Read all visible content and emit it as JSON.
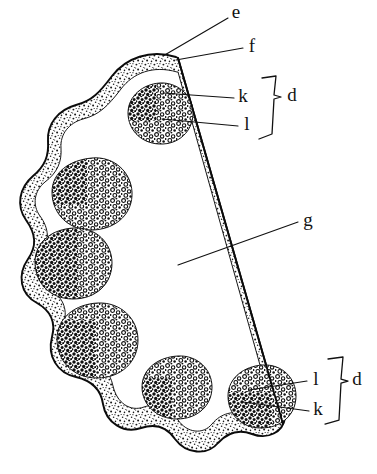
{
  "figure": {
    "background_color": "#ffffff",
    "ink_color": "#111111",
    "stipple_color": "#1b1b1b"
  },
  "labels": [
    {
      "id": "label-e",
      "text": "e",
      "x": 236,
      "y": 14
    },
    {
      "id": "label-f",
      "text": "f",
      "x": 252,
      "y": 48
    },
    {
      "id": "label-k-top",
      "text": "k",
      "x": 243,
      "y": 98
    },
    {
      "id": "label-l-top",
      "text": "l",
      "x": 247,
      "y": 126
    },
    {
      "id": "label-d-top",
      "text": "d",
      "x": 292,
      "y": 97
    },
    {
      "id": "label-g",
      "text": "g",
      "x": 308,
      "y": 222
    },
    {
      "id": "label-l-bottom",
      "text": "l",
      "x": 316,
      "y": 381
    },
    {
      "id": "label-k-bottom",
      "text": "k",
      "x": 318,
      "y": 411
    },
    {
      "id": "label-d-bottom",
      "text": "d",
      "x": 357,
      "y": 381
    }
  ],
  "leaders": [
    {
      "id": "leader-e",
      "from_label": "e",
      "points": "228,18 163,56"
    },
    {
      "id": "leader-f",
      "from_label": "f",
      "points": "243,48 176,60"
    },
    {
      "id": "leader-k-top",
      "from_label": "k",
      "points": "234,98 163,93"
    },
    {
      "id": "leader-l-top",
      "from_label": "l",
      "points": "238,126 162,119"
    },
    {
      "id": "leader-g",
      "from_label": "g",
      "points": "298,222 178,265"
    },
    {
      "id": "leader-l-bottom",
      "from_label": "l",
      "points": "307,381 249,390"
    },
    {
      "id": "leader-k-bottom",
      "from_label": "k",
      "points": "309,411 243,402"
    }
  ],
  "braces": [
    {
      "id": "brace-top",
      "groups": [
        "k",
        "l"
      ],
      "label": "d",
      "side": "right"
    },
    {
      "id": "brace-bottom",
      "groups": [
        "l",
        "k"
      ],
      "label": "d",
      "side": "right"
    }
  ],
  "cut_line": {
    "id": "cut-line-g",
    "name": "straight-section-boundary",
    "points": "178,58 283,424"
  },
  "cell_nests": [
    {
      "id": "nest-1",
      "cx": 160,
      "cy": 113,
      "rx": 33,
      "ry": 30,
      "position": "upper-right"
    },
    {
      "id": "nest-2",
      "cx": 91,
      "cy": 193,
      "rx": 40,
      "ry": 35,
      "position": "upper-left"
    },
    {
      "id": "nest-3",
      "cx": 73,
      "cy": 263,
      "rx": 38,
      "ry": 35,
      "position": "mid-left"
    },
    {
      "id": "nest-4",
      "cx": 97,
      "cy": 340,
      "rx": 40,
      "ry": 37,
      "position": "lower-left"
    },
    {
      "id": "nest-5",
      "cx": 177,
      "cy": 387,
      "rx": 35,
      "ry": 31,
      "position": "lower-center"
    },
    {
      "id": "nest-6",
      "cx": 262,
      "cy": 396,
      "rx": 34,
      "ry": 31,
      "position": "lower-right"
    }
  ],
  "caption": {
    "text": "",
    "note": "caption row is clipped at the bottom edge of the screenshot"
  }
}
